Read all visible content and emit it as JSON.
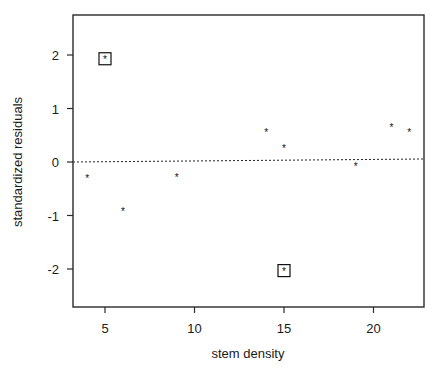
{
  "chart_data": {
    "type": "scatter",
    "title": "",
    "xlabel": "stem density",
    "ylabel": "standardized residuals",
    "xlim": [
      3.2,
      22.8
    ],
    "ylim": [
      -2.7,
      2.7
    ],
    "xticks": [
      5,
      10,
      15,
      20
    ],
    "yticks": [
      -2,
      -1,
      0,
      1,
      2
    ],
    "grid": false,
    "legend": null,
    "reference_line": {
      "y": 0,
      "style": "dotted"
    },
    "marker": "*",
    "points": [
      {
        "x": 4,
        "y": -0.3,
        "highlighted": false
      },
      {
        "x": 5,
        "y": 1.93,
        "highlighted": true
      },
      {
        "x": 6,
        "y": -0.92,
        "highlighted": false
      },
      {
        "x": 9,
        "y": -0.28,
        "highlighted": false
      },
      {
        "x": 14,
        "y": 0.57,
        "highlighted": false
      },
      {
        "x": 15,
        "y": 0.27,
        "highlighted": false
      },
      {
        "x": 15,
        "y": -2.03,
        "highlighted": true
      },
      {
        "x": 19,
        "y": -0.07,
        "highlighted": false
      },
      {
        "x": 21,
        "y": 0.65,
        "highlighted": false
      },
      {
        "x": 22,
        "y": 0.57,
        "highlighted": false
      }
    ]
  },
  "layout": {
    "plot": {
      "left": 73,
      "top": 15,
      "right": 424,
      "bottom": 307
    },
    "x_px": {
      "at5": 105,
      "per_unit": 17.9
    },
    "y_px": {
      "at0": 162,
      "per_unit": 53.5
    },
    "colors": {
      "axis": "#2a2a2a",
      "marker": "#111111",
      "text": "#1a1a1a"
    }
  }
}
